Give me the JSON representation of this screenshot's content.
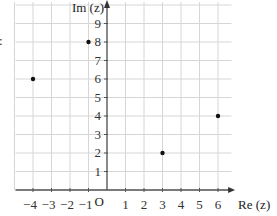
{
  "chart_data": {
    "type": "scatter",
    "title": "",
    "xlabel": "Re (z)",
    "ylabel": "Im (z)",
    "origin_label": "O",
    "xlim": [
      -5,
      6
    ],
    "ylim": [
      0,
      10
    ],
    "grid": true,
    "x_ticks": [
      -4,
      -3,
      -2,
      -1,
      1,
      2,
      3,
      4,
      5,
      6
    ],
    "y_ticks": [
      1,
      2,
      3,
      4,
      5,
      6,
      7,
      8,
      9
    ],
    "points": [
      {
        "x": -4,
        "y": 6
      },
      {
        "x": -1,
        "y": 8
      },
      {
        "x": 3,
        "y": 2
      },
      {
        "x": 6,
        "y": 4
      }
    ]
  },
  "fragment_label": ":"
}
